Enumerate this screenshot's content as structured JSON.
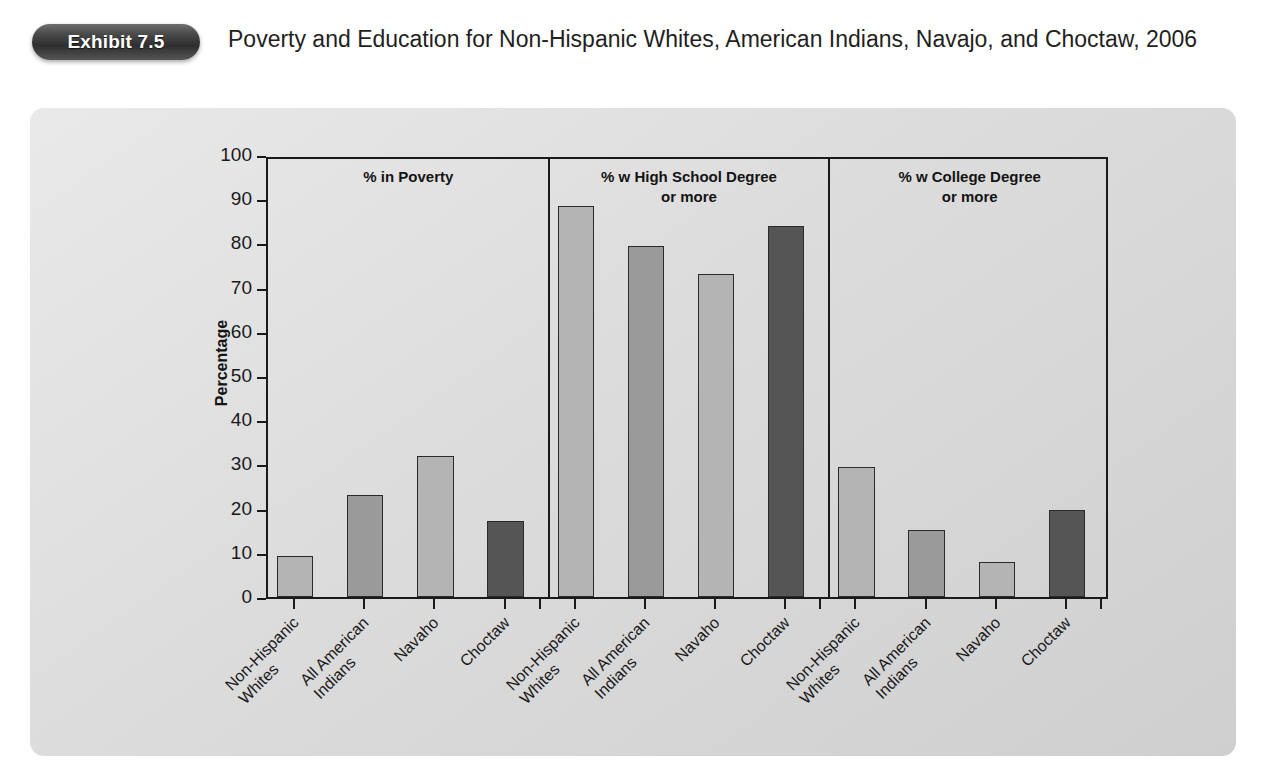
{
  "header": {
    "badge_label": "Exhibit 7.5",
    "title": "Poverty and Education for Non-Hispanic Whites, American Indians, Navajo, and Choctaw, 2006"
  },
  "chart_data": {
    "type": "bar",
    "title": "Poverty and Education for Non-Hispanic Whites, American Indians, Navajo, and Choctaw, 2006",
    "xlabel": "",
    "ylabel": "Percentage",
    "ylim": [
      0,
      100
    ],
    "ytick_step": 10,
    "ytick_labels": [
      "100",
      "90",
      "80",
      "70",
      "60",
      "50",
      "40",
      "30",
      "20",
      "10",
      "0"
    ],
    "grid": false,
    "legend": "none",
    "categories": [
      "Non-Hispanic Whites",
      "All American Indians",
      "Navaho",
      "Choctaw"
    ],
    "category_lines": [
      [
        "Non-Hispanic",
        "Whites"
      ],
      [
        "All American",
        "Indians"
      ],
      [
        "Navaho",
        ""
      ],
      [
        "Choctaw",
        ""
      ]
    ],
    "panels": [
      {
        "header_lines": [
          "%  in Poverty",
          ""
        ],
        "values": [
          9.2,
          23.0,
          32.0,
          17.2
        ]
      },
      {
        "header_lines": [
          "% w High School Degree",
          "or more"
        ],
        "values": [
          88.5,
          79.4,
          73.1,
          83.9
        ]
      },
      {
        "header_lines": [
          "% w College Degree",
          "or more"
        ],
        "values": [
          29.4,
          15.2,
          8.0,
          19.6
        ]
      }
    ],
    "bar_colors": [
      "#b4b4b4",
      "#9a9a9a",
      "#b4b4b4",
      "#555555"
    ],
    "bar_edge_color": "#2a2a2a",
    "axis_color": "#1a1a1a"
  }
}
